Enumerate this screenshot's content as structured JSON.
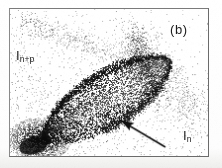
{
  "figure": {
    "panel_label": "(b)",
    "axis_y_label_main": "I",
    "axis_y_label_sub": "n+p",
    "axis_x_label_main": "I",
    "axis_x_label_sub": "n",
    "frame_color": "#6b6b6b",
    "ink_color": "#1b1b1b",
    "background_color": "#ffffff"
  },
  "chart_data": {
    "type": "scatter",
    "title": "(b)",
    "xlabel": "I_n",
    "ylabel": "I_n+p",
    "grid": false,
    "legend": null,
    "xlim": [
      0,
      200
    ],
    "ylim": [
      0,
      149
    ],
    "annotations": [
      {
        "kind": "arrow",
        "label": "",
        "tail_x": 166,
        "tail_y": 148,
        "tip_x": 120,
        "tip_y": 120,
        "color": "#101010"
      },
      {
        "kind": "text",
        "label": "(b)",
        "x": 181,
        "y": 29
      },
      {
        "kind": "text",
        "label": "I_n+p",
        "x": 27,
        "y": 55
      },
      {
        "kind": "text",
        "label": "I_n",
        "x": 194,
        "y": 135
      }
    ],
    "clusters": [
      {
        "name": "dense-lens-locus",
        "description": "main leaf/lens shaped high-density band running lower-left to upper-right",
        "shape": "lens",
        "cx": 98,
        "cy": 92,
        "major_axis": 150,
        "minor_axis": 56,
        "angle_deg": -32,
        "n_points": 5200,
        "darkness": 0.95
      },
      {
        "name": "lens-edge-ridge",
        "description": "dark outline ridge along the upper-right boundary of the lens",
        "shape": "arc",
        "n_points": 1400,
        "darkness": 1.0
      },
      {
        "name": "bottom-left-saturation",
        "description": "saturated black blob at lower left corner of locus",
        "cx": 30,
        "cy": 132,
        "radius": 26,
        "n_points": 2600,
        "darkness": 1.0
      },
      {
        "name": "diffuse-halo",
        "description": "broad sparse background scatter filling the mid field",
        "n_points": 3400,
        "darkness": 0.45
      },
      {
        "name": "upper-left-band",
        "description": "faint sparse band sloping down from upper-left toward centre",
        "n_points": 600,
        "darkness": 0.3
      },
      {
        "name": "right-tail",
        "description": "sparse scattered tail falling to the lower right",
        "n_points": 900,
        "darkness": 0.3
      }
    ]
  }
}
